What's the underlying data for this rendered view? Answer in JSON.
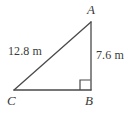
{
  "figure": {
    "type": "right-triangle-diagram",
    "background_color": "#ffffff",
    "stroke_color": "#4a4a4a",
    "text_color": "#3a3a3a",
    "vertices": {
      "a": {
        "label": "A",
        "x": 91,
        "y": 22
      },
      "b": {
        "label": "B",
        "x": 91,
        "y": 90
      },
      "c": {
        "label": "C",
        "x": 14,
        "y": 90
      }
    },
    "sides": [
      {
        "name": "hypotenuse-ca",
        "label": "12.8 m",
        "from": "C",
        "to": "A",
        "value": 12.8,
        "unit": "m"
      },
      {
        "name": "vertical-ab",
        "label": "7.6 m",
        "from": "A",
        "to": "B",
        "value": 7.6,
        "unit": "m"
      },
      {
        "name": "base-cb",
        "label": "",
        "from": "C",
        "to": "B",
        "value": null,
        "unit": "m"
      }
    ],
    "right_angle": {
      "at_vertex": "B",
      "marker": "square",
      "size": 10
    }
  }
}
